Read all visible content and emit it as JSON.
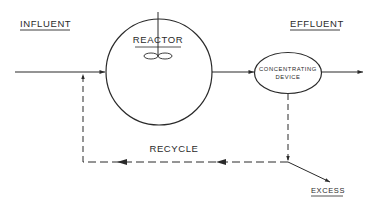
{
  "diagram": {
    "type": "process-flow",
    "colors": {
      "ink": "#2a2a2a",
      "background": "#ffffff"
    },
    "labels": {
      "influent": "INFLUENT",
      "effluent": "EFFLUENT",
      "reactor": "REACTOR",
      "concentrating_line1": "CONCENTRATING",
      "concentrating_line2": "DEVICE",
      "recycle": "RECYCLE",
      "excess": "EXCESS"
    },
    "nodes": [
      {
        "id": "reactor",
        "shape": "circle",
        "label": "REACTOR",
        "has_mixer": true
      },
      {
        "id": "concentrating-device",
        "shape": "ellipse",
        "label": "CONCENTRATING DEVICE"
      }
    ],
    "edges": [
      {
        "from": "influent",
        "to": "reactor",
        "style": "solid"
      },
      {
        "from": "reactor",
        "to": "concentrating-device",
        "style": "solid"
      },
      {
        "from": "concentrating-device",
        "to": "effluent",
        "style": "solid"
      },
      {
        "from": "concentrating-device",
        "to": "recycle-junction",
        "style": "dashed"
      },
      {
        "from": "recycle-junction",
        "to": "influent-line",
        "style": "dashed",
        "label": "RECYCLE"
      },
      {
        "from": "recycle-junction",
        "to": "excess",
        "style": "solid"
      }
    ]
  }
}
